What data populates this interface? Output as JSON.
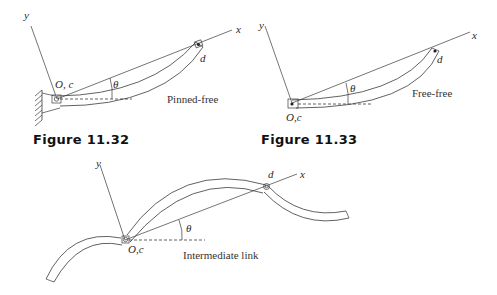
{
  "figures": [
    {
      "id": "fig-11-32",
      "caption": "Figure 11.32",
      "label": "Pinned-free",
      "axis_x": "x",
      "axis_y": "y",
      "origin": "O, c",
      "end_point": "d",
      "angle": "θ"
    },
    {
      "id": "fig-11-33",
      "caption": "Figure 11.33",
      "label": "Free-free",
      "axis_x": "x",
      "axis_y": "y",
      "origin": "O,c",
      "end_point": "d",
      "angle": "θ"
    },
    {
      "id": "fig-intermediate",
      "caption": "",
      "label": "Intermediate link",
      "axis_x": "x",
      "axis_y": "y",
      "origin": "O,c",
      "end_point": "d",
      "angle": "θ"
    }
  ]
}
